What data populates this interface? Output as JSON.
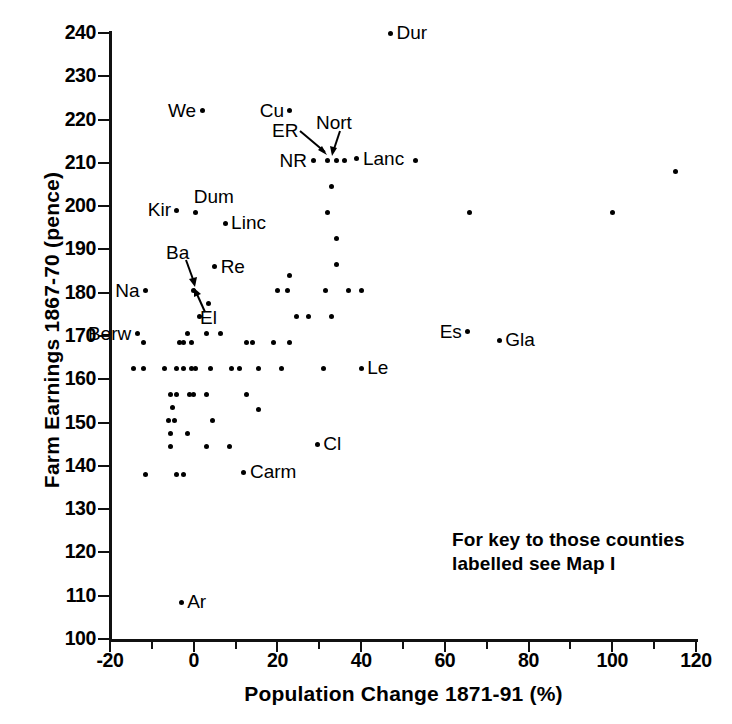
{
  "chart_data": {
    "type": "scatter",
    "title": "",
    "xlabel": "Population Change 1871-91 (%)",
    "ylabel": "Farm Earnings 1867-70 (pence)",
    "xlim": [
      -20,
      120
    ],
    "ylim": [
      100,
      240
    ],
    "xticks": [
      -20,
      0,
      20,
      40,
      60,
      80,
      100,
      120
    ],
    "xtick_labels": [
      "-20",
      "0",
      "20",
      "40",
      "60",
      "80",
      "100",
      "120"
    ],
    "yticks": [
      100,
      110,
      120,
      130,
      140,
      150,
      160,
      170,
      180,
      190,
      200,
      210,
      220,
      230,
      240
    ],
    "ytick_labels": [
      "100",
      "110",
      "120",
      "130",
      "140",
      "150",
      "160",
      "170",
      "180",
      "190",
      "200",
      "210",
      "220",
      "230",
      "240"
    ],
    "xminorticks": [
      -10,
      10,
      30,
      50,
      70,
      90,
      110
    ],
    "grid": false,
    "legend": false,
    "marker_color": "#000000",
    "axis_color": "#111111",
    "annotation": "For key to those counties\nlabelled see Map I",
    "points": [
      {
        "x": 47.0,
        "y": 240.0,
        "label": "Dur",
        "label_pos": "right"
      },
      {
        "x": 2.0,
        "y": 222.0,
        "label": "We",
        "label_pos": "left"
      },
      {
        "x": 23.0,
        "y": 222.0,
        "label": "Cu",
        "label_pos": "left"
      },
      {
        "x": 28.5,
        "y": 210.5,
        "label": "NR",
        "label_pos": "left"
      },
      {
        "x": 32.0,
        "y": 210.5,
        "label": "ER",
        "label_pos": "leader"
      },
      {
        "x": 34.0,
        "y": 210.5,
        "label": "Nort",
        "label_pos": "leader"
      },
      {
        "x": 36.0,
        "y": 210.5,
        "label": "",
        "label_pos": "none"
      },
      {
        "x": 39.0,
        "y": 211.0,
        "label": "Lanc",
        "label_pos": "right"
      },
      {
        "x": 53.0,
        "y": 210.5,
        "label": "",
        "label_pos": "none"
      },
      {
        "x": 115.0,
        "y": 208.0,
        "label": "",
        "label_pos": "none"
      },
      {
        "x": 33.0,
        "y": 204.5,
        "label": "",
        "label_pos": "none"
      },
      {
        "x": -4.0,
        "y": 199.0,
        "label": "Kir",
        "label_pos": "left"
      },
      {
        "x": 0.5,
        "y": 198.5,
        "label": "Dum",
        "label_pos": "above"
      },
      {
        "x": 32.0,
        "y": 198.5,
        "label": "",
        "label_pos": "none"
      },
      {
        "x": 66.0,
        "y": 198.5,
        "label": "",
        "label_pos": "none"
      },
      {
        "x": 100.0,
        "y": 198.5,
        "label": "",
        "label_pos": "none"
      },
      {
        "x": 7.5,
        "y": 196.0,
        "label": "Linc",
        "label_pos": "right"
      },
      {
        "x": 34.0,
        "y": 192.5,
        "label": "",
        "label_pos": "none"
      },
      {
        "x": 5.0,
        "y": 186.0,
        "label": "Re",
        "label_pos": "right"
      },
      {
        "x": 34.0,
        "y": 186.5,
        "label": "",
        "label_pos": "none"
      },
      {
        "x": 23.0,
        "y": 184.0,
        "label": "",
        "label_pos": "none"
      },
      {
        "x": -11.5,
        "y": 180.5,
        "label": "Na",
        "label_pos": "left"
      },
      {
        "x": 0.0,
        "y": 180.5,
        "label": "Ba",
        "label_pos": "leader"
      },
      {
        "x": 20.0,
        "y": 180.5,
        "label": "",
        "label_pos": "none"
      },
      {
        "x": 22.5,
        "y": 180.5,
        "label": "",
        "label_pos": "none"
      },
      {
        "x": 31.5,
        "y": 180.5,
        "label": "",
        "label_pos": "none"
      },
      {
        "x": 37.0,
        "y": 180.5,
        "label": "",
        "label_pos": "none"
      },
      {
        "x": 40.0,
        "y": 180.5,
        "label": "",
        "label_pos": "none"
      },
      {
        "x": 3.5,
        "y": 177.5,
        "label": "",
        "label_pos": "none"
      },
      {
        "x": 1.5,
        "y": 174.5,
        "label": "El",
        "label_pos": "leader"
      },
      {
        "x": 24.5,
        "y": 174.5,
        "label": "",
        "label_pos": "none"
      },
      {
        "x": 27.5,
        "y": 174.5,
        "label": "",
        "label_pos": "none"
      },
      {
        "x": 33.0,
        "y": 174.5,
        "label": "",
        "label_pos": "none"
      },
      {
        "x": -13.5,
        "y": 170.5,
        "label": "Berw",
        "label_pos": "left"
      },
      {
        "x": -1.5,
        "y": 170.5,
        "label": "",
        "label_pos": "none"
      },
      {
        "x": 3.0,
        "y": 170.5,
        "label": "",
        "label_pos": "none"
      },
      {
        "x": 6.5,
        "y": 170.5,
        "label": "",
        "label_pos": "none"
      },
      {
        "x": -12.0,
        "y": 168.5,
        "label": "",
        "label_pos": "none"
      },
      {
        "x": -3.5,
        "y": 168.5,
        "label": "",
        "label_pos": "none"
      },
      {
        "x": -2.5,
        "y": 168.5,
        "label": "",
        "label_pos": "none"
      },
      {
        "x": -0.5,
        "y": 168.5,
        "label": "",
        "label_pos": "none"
      },
      {
        "x": 12.5,
        "y": 168.5,
        "label": "",
        "label_pos": "none"
      },
      {
        "x": 14.0,
        "y": 168.5,
        "label": "",
        "label_pos": "none"
      },
      {
        "x": 19.0,
        "y": 168.5,
        "label": "",
        "label_pos": "none"
      },
      {
        "x": 23.0,
        "y": 168.5,
        "label": "",
        "label_pos": "none"
      },
      {
        "x": -14.5,
        "y": 162.5,
        "label": "",
        "label_pos": "none"
      },
      {
        "x": -12.0,
        "y": 162.5,
        "label": "",
        "label_pos": "none"
      },
      {
        "x": -7.0,
        "y": 162.5,
        "label": "",
        "label_pos": "none"
      },
      {
        "x": -4.0,
        "y": 162.5,
        "label": "",
        "label_pos": "none"
      },
      {
        "x": -2.5,
        "y": 162.5,
        "label": "",
        "label_pos": "none"
      },
      {
        "x": -0.5,
        "y": 162.5,
        "label": "",
        "label_pos": "none"
      },
      {
        "x": 0.5,
        "y": 162.5,
        "label": "",
        "label_pos": "none"
      },
      {
        "x": 4.0,
        "y": 162.5,
        "label": "",
        "label_pos": "none"
      },
      {
        "x": 9.0,
        "y": 162.5,
        "label": "",
        "label_pos": "none"
      },
      {
        "x": 11.0,
        "y": 162.5,
        "label": "",
        "label_pos": "none"
      },
      {
        "x": 15.5,
        "y": 162.5,
        "label": "",
        "label_pos": "none"
      },
      {
        "x": 21.0,
        "y": 162.5,
        "label": "",
        "label_pos": "none"
      },
      {
        "x": 31.0,
        "y": 162.5,
        "label": "",
        "label_pos": "none"
      },
      {
        "x": 40.0,
        "y": 162.5,
        "label": "Le",
        "label_pos": "right"
      },
      {
        "x": -5.5,
        "y": 156.5,
        "label": "",
        "label_pos": "none"
      },
      {
        "x": -4.0,
        "y": 156.5,
        "label": "",
        "label_pos": "none"
      },
      {
        "x": -1.0,
        "y": 156.5,
        "label": "",
        "label_pos": "none"
      },
      {
        "x": 0.0,
        "y": 156.5,
        "label": "",
        "label_pos": "none"
      },
      {
        "x": 3.0,
        "y": 156.5,
        "label": "",
        "label_pos": "none"
      },
      {
        "x": 12.5,
        "y": 156.5,
        "label": "",
        "label_pos": "none"
      },
      {
        "x": -5.0,
        "y": 153.5,
        "label": "",
        "label_pos": "none"
      },
      {
        "x": 15.5,
        "y": 153.0,
        "label": "",
        "label_pos": "none"
      },
      {
        "x": -6.0,
        "y": 150.5,
        "label": "",
        "label_pos": "none"
      },
      {
        "x": -4.5,
        "y": 150.5,
        "label": "",
        "label_pos": "none"
      },
      {
        "x": 4.5,
        "y": 150.5,
        "label": "",
        "label_pos": "none"
      },
      {
        "x": -5.5,
        "y": 147.5,
        "label": "",
        "label_pos": "none"
      },
      {
        "x": -1.5,
        "y": 147.5,
        "label": "",
        "label_pos": "none"
      },
      {
        "x": -5.5,
        "y": 144.5,
        "label": "",
        "label_pos": "none"
      },
      {
        "x": 3.0,
        "y": 144.5,
        "label": "",
        "label_pos": "none"
      },
      {
        "x": 8.5,
        "y": 144.5,
        "label": "",
        "label_pos": "none"
      },
      {
        "x": 29.5,
        "y": 145.0,
        "label": "Cl",
        "label_pos": "right"
      },
      {
        "x": -11.5,
        "y": 138.0,
        "label": "",
        "label_pos": "none"
      },
      {
        "x": -4.0,
        "y": 138.0,
        "label": "",
        "label_pos": "none"
      },
      {
        "x": -2.5,
        "y": 138.0,
        "label": "",
        "label_pos": "none"
      },
      {
        "x": 12.0,
        "y": 138.5,
        "label": "Carm",
        "label_pos": "right"
      },
      {
        "x": 65.5,
        "y": 171.0,
        "label": "Es",
        "label_pos": "left"
      },
      {
        "x": 73.0,
        "y": 169.0,
        "label": "Gla",
        "label_pos": "right"
      },
      {
        "x": -3.0,
        "y": 108.5,
        "label": "Ar",
        "label_pos": "right"
      }
    ]
  }
}
